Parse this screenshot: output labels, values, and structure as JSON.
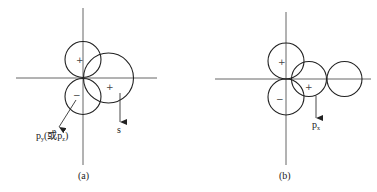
{
  "panels": [
    {
      "id": "a",
      "caption": "(a)",
      "signs": {
        "top_circle": "+",
        "bottom_circle": "−",
        "large_circle": "+"
      },
      "labels": {
        "diag_arrow_main": "p",
        "diag_arrow_sub1": "y",
        "diag_arrow_mid": "(或p",
        "diag_arrow_sub2": "z",
        "diag_arrow_end": ")",
        "vertical_arrow": "s"
      },
      "description": "p_y (or p_z) orbital lobes with an s orbital overlapping"
    },
    {
      "id": "b",
      "caption": "(b)",
      "signs": {
        "top_circle": "+",
        "bottom_circle": "−",
        "middle_circle": "+"
      },
      "labels": {
        "vertical_arrow_main": "p",
        "vertical_arrow_sub": "x"
      },
      "description": "p_x orbital overlapping with p lobes"
    }
  ]
}
